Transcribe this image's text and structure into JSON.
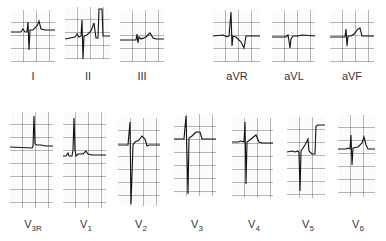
{
  "figure": {
    "grid_color_major": "#222222",
    "grid_color_minor": "#9a9a9a",
    "trace_color": "#111111"
  },
  "limb_leads": [
    {
      "id": "I",
      "label": "I",
      "sub": ""
    },
    {
      "id": "II",
      "label": "II",
      "sub": ""
    },
    {
      "id": "III",
      "label": "III",
      "sub": ""
    }
  ],
  "augmented_leads": [
    {
      "id": "aVR",
      "label": "aVR",
      "sub": ""
    },
    {
      "id": "aVL",
      "label": "aVL",
      "sub": ""
    },
    {
      "id": "aVF",
      "label": "aVF",
      "sub": ""
    }
  ],
  "precordial_leads": [
    {
      "id": "V3R",
      "label": "V",
      "sub": "3R"
    },
    {
      "id": "V1",
      "label": "V",
      "sub": "1"
    },
    {
      "id": "V2",
      "label": "V",
      "sub": "2"
    },
    {
      "id": "V3",
      "label": "V",
      "sub": "3"
    },
    {
      "id": "V4",
      "label": "V",
      "sub": "4"
    },
    {
      "id": "V5",
      "label": "V",
      "sub": "5"
    },
    {
      "id": "V6",
      "label": "V",
      "sub": "6"
    }
  ]
}
